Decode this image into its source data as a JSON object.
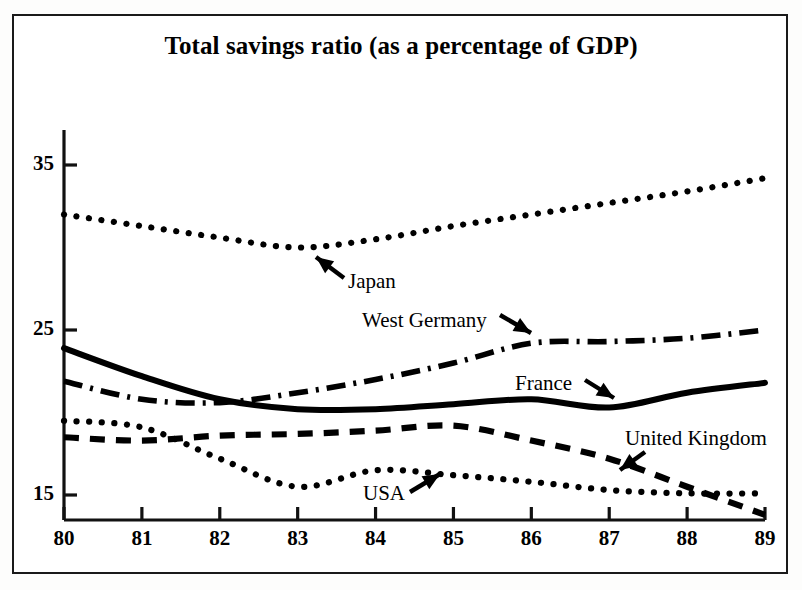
{
  "chart_data": {
    "type": "line",
    "title": "Total savings ratio (as a percentage of GDP)",
    "xlabel": "",
    "ylabel": "",
    "x": [
      80,
      81,
      82,
      83,
      84,
      85,
      86,
      87,
      88,
      89
    ],
    "categories": [
      "80",
      "81",
      "82",
      "83",
      "84",
      "85",
      "86",
      "87",
      "88",
      "89"
    ],
    "xticklabels": [
      "80",
      "81",
      "82",
      "83",
      "84",
      "85",
      "86",
      "87",
      "88",
      "89"
    ],
    "yticklabels": [
      "35",
      "25",
      "15"
    ],
    "yticks": [
      35,
      25,
      15
    ],
    "xlim": [
      80,
      89
    ],
    "ylim": [
      12.5,
      36.5
    ],
    "grid": false,
    "legend": "inline-annotations",
    "series": [
      {
        "name": "Japan",
        "style": "dotted",
        "color": "#000000",
        "values": [
          32.0,
          31.3,
          30.6,
          30.0,
          30.5,
          31.3,
          32.0,
          32.7,
          33.4,
          34.2
        ]
      },
      {
        "name": "West Germany",
        "style": "dash-dot",
        "color": "#000000",
        "values": [
          21.9,
          20.8,
          20.6,
          21.2,
          22.0,
          23.0,
          24.2,
          24.3,
          24.5,
          25.0
        ]
      },
      {
        "name": "France",
        "style": "solid",
        "color": "#000000",
        "values": [
          23.9,
          22.2,
          20.8,
          20.2,
          20.2,
          20.5,
          20.8,
          20.3,
          21.2,
          21.8
        ]
      },
      {
        "name": "United Kingdom",
        "style": "dashed",
        "color": "#000000",
        "values": [
          18.5,
          18.3,
          18.6,
          18.7,
          18.9,
          19.2,
          18.3,
          17.2,
          15.5,
          13.8
        ]
      },
      {
        "name": "USA",
        "style": "dotted",
        "color": "#000000",
        "values": [
          19.5,
          19.1,
          17.2,
          15.5,
          16.5,
          16.2,
          15.8,
          15.3,
          15.1,
          15.1
        ]
      }
    ],
    "annotations": [
      {
        "text": "Japan",
        "label_x": 348,
        "label_y": 283,
        "arrow_from_x": 344,
        "arrow_from_y": 278,
        "arrow_to_x": 316,
        "arrow_to_y": 257
      },
      {
        "text": "West Germany",
        "label_x": 362,
        "label_y": 322,
        "arrow_from_x": 500,
        "arrow_from_y": 315,
        "arrow_to_x": 531,
        "arrow_to_y": 333
      },
      {
        "text": "France",
        "label_x": 515,
        "label_y": 385,
        "arrow_from_x": 585,
        "arrow_from_y": 380,
        "arrow_to_x": 614,
        "arrow_to_y": 398
      },
      {
        "text": "United Kingdom",
        "label_x": 625,
        "label_y": 440,
        "arrow_from_x": 645,
        "arrow_from_y": 452,
        "arrow_to_x": 620,
        "arrow_to_y": 470
      },
      {
        "text": "USA",
        "label_x": 363,
        "label_y": 495,
        "arrow_from_x": 410,
        "arrow_from_y": 492,
        "arrow_to_x": 440,
        "arrow_to_y": 474
      }
    ]
  }
}
